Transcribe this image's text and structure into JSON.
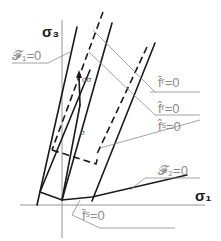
{
  "diagram": {
    "axes": {
      "vertical_label": "σ₃",
      "horizontal_label": "σ₁"
    },
    "labels": {
      "f1": "𝓕₁=0",
      "f2": "𝓕₂=0",
      "fr_bar": "f̄ʳ=0",
      "fr_hat": "f̂ʳ=0",
      "fs_hat": "f̂ˢ=0",
      "fs_bar": "f̄ˢ=0",
      "sigma": "σ",
      "dsigma": "dσ"
    },
    "colors": {
      "line": "#1a1a1a",
      "axis": "#8a8a8a",
      "annotation": "#8a8a8a"
    }
  }
}
